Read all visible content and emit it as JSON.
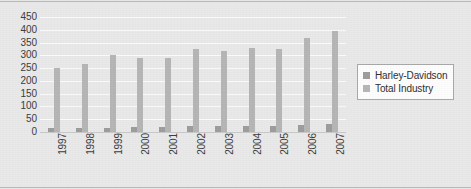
{
  "chart_data": {
    "type": "bar",
    "title": "",
    "subtitle": "",
    "xlabel": "",
    "ylabel": "",
    "categories": [
      "1997",
      "1998",
      "1999",
      "2000",
      "2001",
      "2002",
      "2003",
      "2004",
      "2005",
      "2006",
      "2007"
    ],
    "series": [
      {
        "name": "Harley-Davidson",
        "color": "#9d9d9d",
        "values": [
          16,
          16,
          17,
          21,
          20,
          23,
          24,
          25,
          25,
          28,
          33
        ]
      },
      {
        "name": "Total Industry",
        "color": "#b6b6b6",
        "values": [
          250,
          268,
          302,
          290,
          288,
          326,
          316,
          330,
          324,
          368,
          395
        ]
      }
    ],
    "ylim": [
      0,
      450
    ],
    "ytick_step": 50,
    "yticks": [
      "450",
      "400",
      "350",
      "300",
      "250",
      "200",
      "150",
      "100",
      "50",
      "0"
    ],
    "grid": true,
    "legend_position": "right",
    "legend_entries": [
      "Harley-Davidson",
      "Total Industry"
    ]
  },
  "legend": {
    "items": [
      {
        "label": "Harley-Davidson",
        "swatch": "#9d9d9d"
      },
      {
        "label": "Total Industry",
        "swatch": "#b6b6b6"
      }
    ]
  },
  "colors": {
    "background": "#e9e9e9",
    "gridline": "#fbfbfb",
    "axis_text": "#3b3b3b",
    "legend_background": "#fdfdfd",
    "legend_border": "#a9a9a9",
    "frame_rule": "#b9b9b9"
  }
}
